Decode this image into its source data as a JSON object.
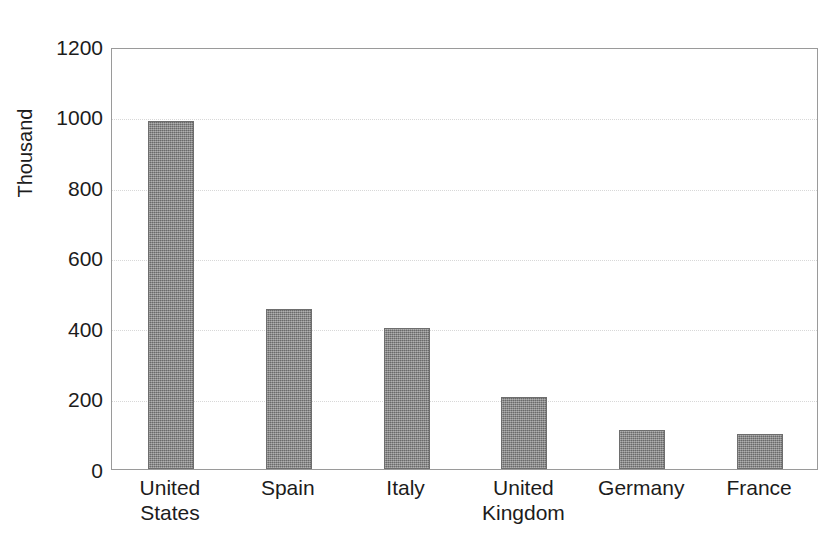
{
  "chart_data": {
    "type": "bar",
    "title": "",
    "subtitle": "",
    "xlabel": "",
    "ylabel": "Thousand",
    "categories": [
      "United States",
      "Spain",
      "Italy",
      "United Kingdom",
      "Germany",
      "France"
    ],
    "category_lines": [
      [
        "United",
        "States"
      ],
      [
        "Spain",
        ""
      ],
      [
        "Italy",
        ""
      ],
      [
        "United",
        "Kingdom"
      ],
      [
        "Germany",
        ""
      ],
      [
        "France",
        ""
      ]
    ],
    "values": [
      990,
      455,
      402,
      205,
      111,
      100
    ],
    "ylim": [
      0,
      1200
    ],
    "yticks": [
      0,
      200,
      400,
      600,
      800,
      1000,
      1200
    ],
    "ytick_labels": [
      "0",
      "200",
      "400",
      "600",
      "800",
      "1000",
      "1200"
    ],
    "grid": true,
    "grid_axis": "y",
    "legend": false,
    "legend_position": "none",
    "bar_color": "#808080",
    "bar_edge_color": "#6e6e6e",
    "gridline_color": "#d8d8d8",
    "axis_color": "#9a9a9a",
    "background_color": "#ffffff",
    "text_color": "#1c1c1c"
  }
}
